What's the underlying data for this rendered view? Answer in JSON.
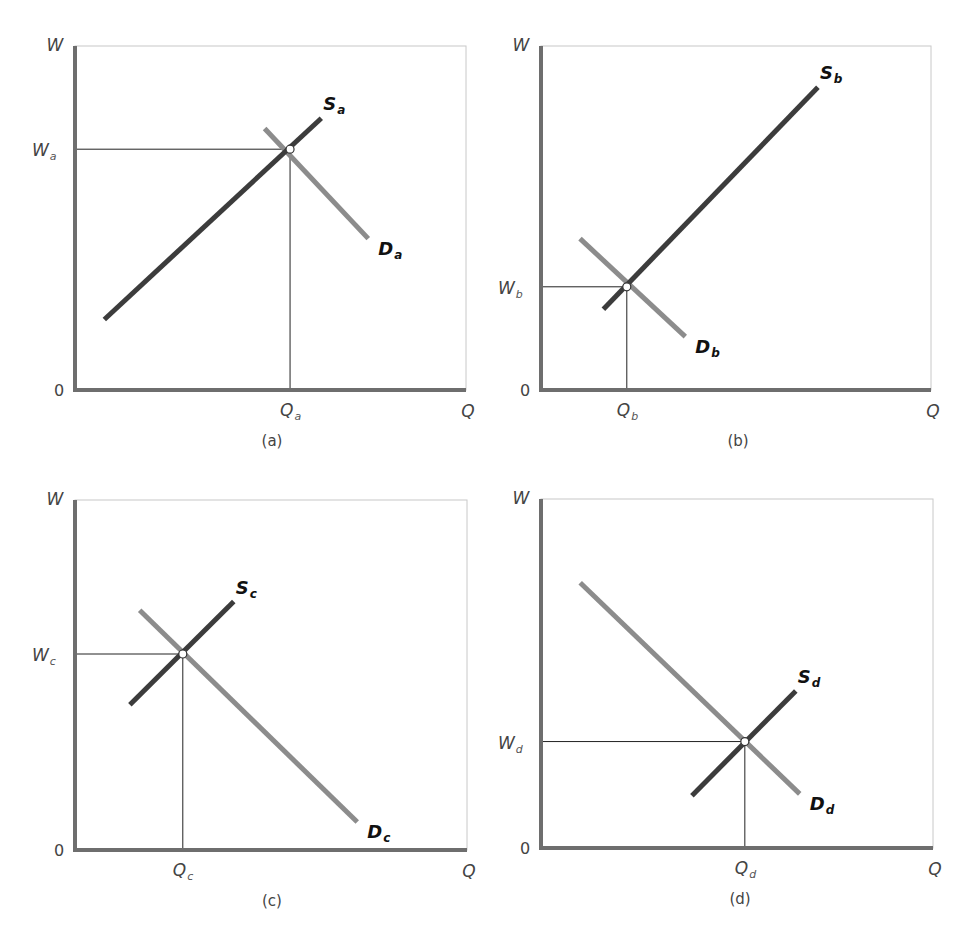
{
  "colors": {
    "frame": "#c8c8c8",
    "axis": "#6e6e6e",
    "supply": "#3c3c3c",
    "demand": "#8c8c8c",
    "guide": "#222222",
    "point_fill": "#ffffff",
    "point_stroke": "#333333"
  },
  "labels": {
    "y_axis": "W",
    "x_axis": "Q",
    "origin": "0"
  },
  "chart_data": [
    {
      "type": "line",
      "panel": "(a)",
      "title": "(a)",
      "xlabel": "Q",
      "ylabel": "W",
      "grid": false,
      "equilibrium": {
        "w_label": "W",
        "w_sub": "a",
        "q_label": "Q",
        "q_sub": "a",
        "x": 0.55,
        "y": 0.7
      },
      "series": [
        {
          "name": "S",
          "sub": "a",
          "kind": "supply",
          "points": [
            [
              0.075,
              0.205
            ],
            [
              0.63,
              0.79
            ]
          ]
        },
        {
          "name": "D",
          "sub": "a",
          "kind": "demand",
          "points": [
            [
              0.485,
              0.76
            ],
            [
              0.75,
              0.44
            ]
          ]
        }
      ]
    },
    {
      "type": "line",
      "panel": "(b)",
      "title": "(b)",
      "xlabel": "Q",
      "ylabel": "W",
      "grid": false,
      "equilibrium": {
        "w_label": "W",
        "w_sub": "b",
        "q_label": "Q",
        "q_sub": "b",
        "x": 0.22,
        "y": 0.3
      },
      "series": [
        {
          "name": "S",
          "sub": "b",
          "kind": "supply",
          "points": [
            [
              0.16,
              0.235
            ],
            [
              0.71,
              0.88
            ]
          ]
        },
        {
          "name": "D",
          "sub": "b",
          "kind": "demand",
          "points": [
            [
              0.1,
              0.44
            ],
            [
              0.37,
              0.155
            ]
          ]
        }
      ]
    },
    {
      "type": "line",
      "panel": "(c)",
      "title": "(c)",
      "xlabel": "Q",
      "ylabel": "W",
      "grid": false,
      "equilibrium": {
        "w_label": "W",
        "w_sub": "c",
        "q_label": "Q",
        "q_sub": "c",
        "x": 0.275,
        "y": 0.56
      },
      "series": [
        {
          "name": "S",
          "sub": "c",
          "kind": "supply",
          "points": [
            [
              0.14,
              0.415
            ],
            [
              0.405,
              0.71
            ]
          ]
        },
        {
          "name": "D",
          "sub": "c",
          "kind": "demand",
          "points": [
            [
              0.165,
              0.685
            ],
            [
              0.72,
              0.08
            ]
          ]
        }
      ]
    },
    {
      "type": "line",
      "panel": "(d)",
      "title": "(d)",
      "xlabel": "Q",
      "ylabel": "W",
      "grid": false,
      "equilibrium": {
        "w_label": "W",
        "w_sub": "d",
        "q_label": "Q",
        "q_sub": "d",
        "x": 0.52,
        "y": 0.305
      },
      "series": [
        {
          "name": "S",
          "sub": "d",
          "kind": "supply",
          "points": [
            [
              0.385,
              0.15
            ],
            [
              0.65,
              0.45
            ]
          ]
        },
        {
          "name": "D",
          "sub": "d",
          "kind": "demand",
          "points": [
            [
              0.1,
              0.76
            ],
            [
              0.66,
              0.155
            ]
          ]
        }
      ]
    }
  ]
}
